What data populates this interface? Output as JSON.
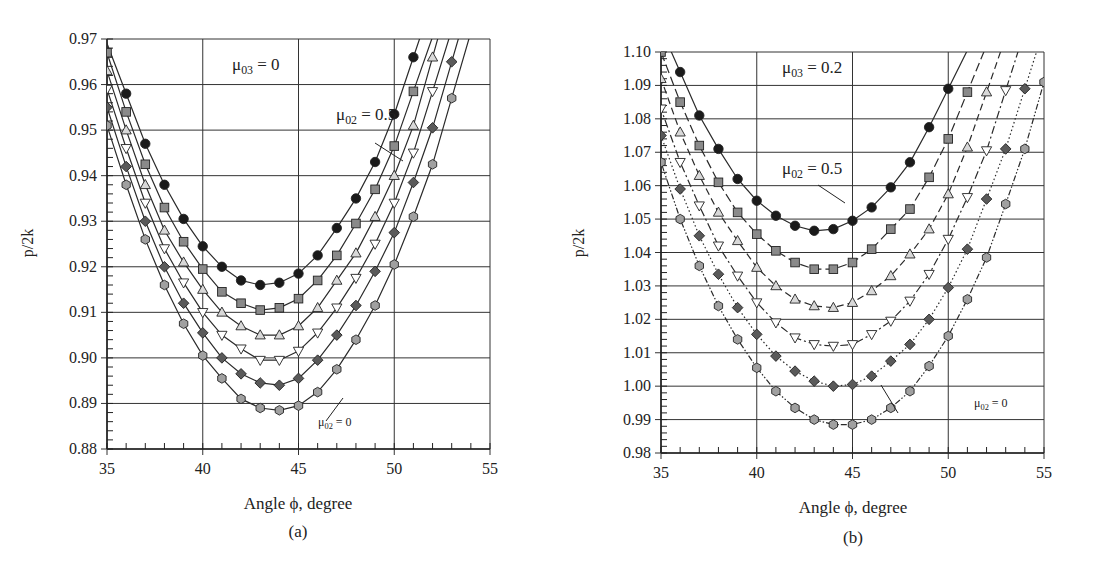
{
  "chart_data": [
    {
      "type": "line",
      "panel_label": "(a)",
      "title": "",
      "annotations": {
        "condition": "μ03 = 0",
        "top_curve": "μ02 = 0.5",
        "bottom_curve": "μ02 = 0"
      },
      "xlabel": "Angle ϕ, degree",
      "ylabel": "p/2k",
      "xlim": [
        35,
        55
      ],
      "ylim": [
        0.88,
        0.97
      ],
      "xticks": [
        "35",
        "40",
        "45",
        "50",
        "55"
      ],
      "yticks": [
        "0.88",
        "0.89",
        "0.90",
        "0.91",
        "0.92",
        "0.93",
        "0.94",
        "0.95",
        "0.96",
        "0.97"
      ],
      "grid": true,
      "legend": "none (inline labels)",
      "series": [
        {
          "name": "μ02 = 0.5",
          "marker": "circle",
          "fill": "#1a1a1a",
          "line": "solid",
          "x": [
            36,
            37,
            38,
            39,
            40,
            41,
            42,
            43,
            44,
            45,
            46,
            47,
            48,
            49,
            50,
            51
          ],
          "values": [
            0.958,
            0.947,
            0.938,
            0.9305,
            0.9245,
            0.92,
            0.917,
            0.916,
            0.9165,
            0.9185,
            0.9225,
            0.9285,
            0.935,
            0.943,
            0.9535,
            0.966
          ]
        },
        {
          "name": "μ02 = 0.4",
          "marker": "square",
          "fill": "#8a8a8a",
          "line": "solid",
          "x": [
            35,
            36,
            37,
            38,
            39,
            40,
            41,
            42,
            43,
            44,
            45,
            46,
            47,
            48,
            49,
            50,
            51
          ],
          "values": [
            0.967,
            0.954,
            0.9425,
            0.933,
            0.9255,
            0.9195,
            0.9145,
            0.912,
            0.9105,
            0.911,
            0.913,
            0.917,
            0.9225,
            0.9295,
            0.937,
            0.9465,
            0.9585
          ]
        },
        {
          "name": "μ02 = 0.3",
          "marker": "triangle-up",
          "fill": "#d8d8d8",
          "line": "solid",
          "x": [
            35,
            36,
            37,
            38,
            39,
            40,
            41,
            42,
            43,
            44,
            45,
            46,
            47,
            48,
            49,
            50,
            51,
            52
          ],
          "values": [
            0.963,
            0.95,
            0.938,
            0.928,
            0.921,
            0.915,
            0.91,
            0.907,
            0.905,
            0.905,
            0.907,
            0.911,
            0.917,
            0.923,
            0.931,
            0.94,
            0.951,
            0.966
          ]
        },
        {
          "name": "μ02 = 0.2",
          "marker": "triangle-down",
          "fill": "#ffffff",
          "line": "solid",
          "x": [
            35,
            36,
            37,
            38,
            39,
            40,
            41,
            42,
            43,
            44,
            45,
            46,
            47,
            48,
            49,
            50,
            51,
            52
          ],
          "values": [
            0.959,
            0.946,
            0.934,
            0.924,
            0.9165,
            0.91,
            0.905,
            0.902,
            0.8995,
            0.8995,
            0.9015,
            0.9055,
            0.911,
            0.9175,
            0.925,
            0.934,
            0.945,
            0.9585
          ]
        },
        {
          "name": "μ02 = 0.1",
          "marker": "diamond",
          "fill": "#5a5a5a",
          "line": "solid",
          "x": [
            35,
            36,
            37,
            38,
            39,
            40,
            41,
            42,
            43,
            44,
            45,
            46,
            47,
            48,
            49,
            50,
            51,
            52,
            53
          ],
          "values": [
            0.955,
            0.942,
            0.93,
            0.92,
            0.912,
            0.9055,
            0.9,
            0.8965,
            0.8945,
            0.894,
            0.8955,
            0.8995,
            0.905,
            0.9115,
            0.919,
            0.9275,
            0.9385,
            0.9505,
            0.965
          ]
        },
        {
          "name": "μ02 = 0",
          "marker": "hexagon",
          "fill": "#a0a0a0",
          "line": "solid",
          "x": [
            35,
            36,
            37,
            38,
            39,
            40,
            41,
            42,
            43,
            44,
            45,
            46,
            47,
            48,
            49,
            50,
            51,
            52,
            53
          ],
          "values": [
            0.951,
            0.938,
            0.926,
            0.916,
            0.9075,
            0.9005,
            0.8955,
            0.891,
            0.889,
            0.8885,
            0.8895,
            0.8925,
            0.8975,
            0.904,
            0.9115,
            0.9205,
            0.931,
            0.9425,
            0.957
          ]
        }
      ]
    },
    {
      "type": "line",
      "panel_label": "(b)",
      "title": "",
      "annotations": {
        "condition": "μ03 = 0.2",
        "top_curve": "μ02 = 0.5",
        "bottom_curve": "μ02 = 0"
      },
      "xlabel": "Angle ϕ, degree",
      "ylabel": "p/2k",
      "xlim": [
        35,
        55
      ],
      "ylim": [
        0.98,
        1.1
      ],
      "xticks": [
        "35",
        "40",
        "45",
        "50",
        "55"
      ],
      "yticks": [
        "0.98",
        "0.99",
        "1.00",
        "1.01",
        "1.02",
        "1.03",
        "1.04",
        "1.05",
        "1.06",
        "1.07",
        "1.08",
        "1.09",
        "1.10"
      ],
      "grid": true,
      "legend": "none (inline labels)",
      "series": [
        {
          "name": "μ02 = 0.5",
          "marker": "circle",
          "fill": "#1a1a1a",
          "line": "solid",
          "x": [
            36,
            37,
            38,
            39,
            40,
            41,
            42,
            43,
            44,
            45,
            46,
            47,
            48,
            49,
            50
          ],
          "values": [
            1.094,
            1.081,
            1.071,
            1.062,
            1.0555,
            1.051,
            1.048,
            1.0465,
            1.047,
            1.0495,
            1.0535,
            1.0595,
            1.067,
            1.0775,
            1.089
          ]
        },
        {
          "name": "μ02 = 0.4",
          "marker": "square",
          "fill": "#8a8a8a",
          "line": "dash-long",
          "x": [
            35,
            36,
            37,
            38,
            39,
            40,
            41,
            42,
            43,
            44,
            45,
            46,
            47,
            48,
            49,
            50,
            51
          ],
          "values": [
            1.1,
            1.085,
            1.072,
            1.061,
            1.052,
            1.0455,
            1.0405,
            1.037,
            1.035,
            1.035,
            1.037,
            1.041,
            1.047,
            1.053,
            1.0625,
            1.074,
            1.088
          ]
        },
        {
          "name": "μ02 = 0.3",
          "marker": "triangle-up",
          "fill": "#d8d8d8",
          "line": "dash",
          "x": [
            35,
            36,
            37,
            38,
            39,
            40,
            41,
            42,
            43,
            44,
            45,
            46,
            47,
            48,
            49,
            50,
            51,
            52
          ],
          "values": [
            1.092,
            1.076,
            1.063,
            1.052,
            1.0435,
            1.0355,
            1.03,
            1.026,
            1.024,
            1.0235,
            1.025,
            1.0285,
            1.033,
            1.0395,
            1.047,
            1.0575,
            1.0715,
            1.088
          ]
        },
        {
          "name": "μ02 = 0.2",
          "marker": "triangle-down",
          "fill": "#ffffff",
          "line": "dash-dot",
          "x": [
            35,
            36,
            37,
            38,
            39,
            40,
            41,
            42,
            43,
            44,
            45,
            46,
            47,
            48,
            49,
            50,
            51,
            52,
            53
          ],
          "values": [
            1.083,
            1.067,
            1.054,
            1.042,
            1.033,
            1.025,
            1.019,
            1.0145,
            1.0125,
            1.012,
            1.0125,
            1.0155,
            1.0195,
            1.0255,
            1.0335,
            1.044,
            1.0565,
            1.0705,
            1.0885
          ]
        },
        {
          "name": "μ02 = 0.1",
          "marker": "diamond",
          "fill": "#5a5a5a",
          "line": "dotted",
          "x": [
            35,
            36,
            37,
            38,
            39,
            40,
            41,
            42,
            43,
            44,
            45,
            46,
            47,
            48,
            49,
            50,
            51,
            52,
            53,
            54
          ],
          "values": [
            1.075,
            1.059,
            1.045,
            1.0335,
            1.0235,
            1.0155,
            1.009,
            1.0045,
            1.0015,
            1.0,
            1.0005,
            1.003,
            1.0075,
            1.0125,
            1.02,
            1.0295,
            1.041,
            1.056,
            1.071,
            1.089
          ]
        },
        {
          "name": "μ02 = 0",
          "marker": "hexagon",
          "fill": "#a0a0a0",
          "line": "dash-dot-dot",
          "x": [
            35,
            36,
            37,
            38,
            39,
            40,
            41,
            42,
            43,
            44,
            45,
            46,
            47,
            48,
            49,
            50,
            51,
            52,
            53,
            54,
            55
          ],
          "values": [
            1.067,
            1.05,
            1.036,
            1.024,
            1.014,
            1.0055,
            0.9985,
            0.9935,
            0.99,
            0.9885,
            0.9885,
            0.99,
            0.9935,
            0.9985,
            1.006,
            1.015,
            1.026,
            1.0385,
            1.0545,
            1.071,
            1.091
          ]
        }
      ]
    }
  ],
  "panels": {
    "a": {
      "caption": "(a)",
      "xlabel": "Angle ϕ, degree",
      "ylabel": "p/2k",
      "condition_label": {
        "sym": "μ",
        "sub": "03",
        "rest": " = 0"
      },
      "top_label": {
        "sym": "μ",
        "sub": "02",
        "rest": " = 0.5"
      },
      "bottom_label": {
        "sym": "μ",
        "sub": "02",
        "rest": " = 0"
      }
    },
    "b": {
      "caption": "(b)",
      "xlabel": "Angle ϕ, degree",
      "ylabel": "p/2k",
      "condition_label": {
        "sym": "μ",
        "sub": "03",
        "rest": " = 0.2"
      },
      "top_label": {
        "sym": "μ",
        "sub": "02",
        "rest": " = 0.5"
      },
      "bottom_label": {
        "sym": "μ",
        "sub": "02",
        "rest": " = 0"
      }
    }
  },
  "colors": {
    "axis": "#222222",
    "grid": "#333333",
    "series_line": "#2a2a2a",
    "marker_stroke": "#222222"
  }
}
